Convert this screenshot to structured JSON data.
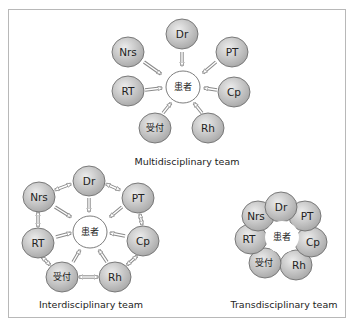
{
  "colors": {
    "node_fill_light": "#e6e6e6",
    "node_fill_dark": "#a9a9a9",
    "node_stroke": "#6e6e6e",
    "center_fill": "#ffffff",
    "arrow": "#8a8a8a",
    "frame_border": "#b8b8b8"
  },
  "diagrams": {
    "multidisciplinary": {
      "title": "Multidisciplinary team",
      "center": "患者",
      "nodes": {
        "dr": "Dr",
        "pt": "PT",
        "cp": "Cp",
        "rh": "Rh",
        "uketsuke": "受付",
        "rt": "RT",
        "nrs": "Nrs"
      }
    },
    "interdisciplinary": {
      "title": "Interdisciplinary team",
      "center": "患者",
      "nodes": {
        "dr": "Dr",
        "pt": "PT",
        "cp": "Cp",
        "rh": "Rh",
        "uketsuke": "受付",
        "rt": "RT",
        "nrs": "Nrs"
      }
    },
    "transdisciplinary": {
      "title": "Transdisciplinary team",
      "center": "患者",
      "nodes": {
        "dr": "Dr",
        "pt": "PT",
        "cp": "Cp",
        "rh": "Rh",
        "uketsuke": "受付",
        "rt": "RT",
        "nrs": "Nrs"
      }
    }
  }
}
